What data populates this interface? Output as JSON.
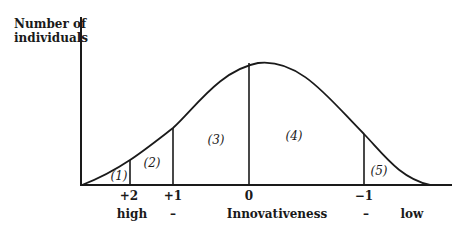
{
  "diagram": {
    "y_axis_label_line1": "Number of",
    "y_axis_label_line2": "individuals",
    "x_axis_label": "Innovativeness",
    "ticks": [
      "+2",
      "+1",
      "0",
      "−1"
    ],
    "bottom_labels": {
      "left": "high",
      "left_dash": "–",
      "right_dash": "–",
      "right": "low"
    },
    "segments": [
      "(1)",
      "(2)",
      "(3)",
      "(4)",
      "(5)"
    ],
    "curve_type": "bell-shaped distribution, right-skewed (peak near 0, slightly right)",
    "line_color": "#1a1a1a"
  }
}
